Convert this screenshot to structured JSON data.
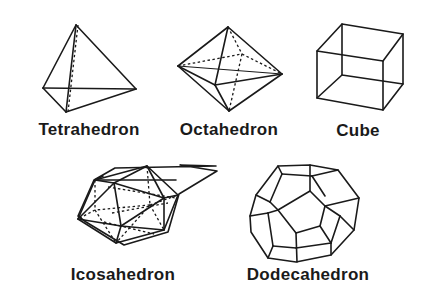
{
  "diagram": {
    "solids": [
      {
        "id": "tetrahedron",
        "label": "Tetrahedron",
        "faces": 4
      },
      {
        "id": "octahedron",
        "label": "Octahedron",
        "faces": 8
      },
      {
        "id": "cube",
        "label": "Cube",
        "faces": 6
      },
      {
        "id": "icosahedron",
        "label": "Icosahedron",
        "faces": 20
      },
      {
        "id": "dodecahedron",
        "label": "Dodecahedron",
        "faces": 12
      }
    ],
    "colors": {
      "background": "#ffffff",
      "line": "#1a1a1a",
      "text": "#1a1a1a"
    }
  }
}
